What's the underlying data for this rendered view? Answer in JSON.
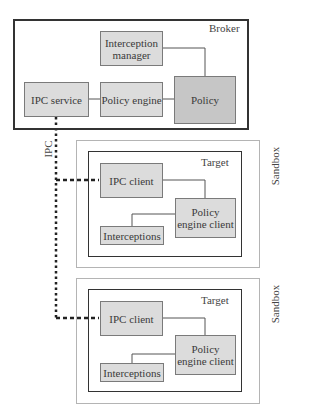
{
  "broker": {
    "label": "Broker",
    "nodes": {
      "interception_manager": "Interception manager",
      "ipc_service": "IPC service",
      "policy_engine": "Policy engine",
      "policy": "Policy"
    }
  },
  "channel": {
    "label": "IPC"
  },
  "sandboxes": [
    {
      "label": "Sandbox",
      "target": {
        "label": "Target",
        "nodes": {
          "ipc_client": "IPC client",
          "policy_engine_client": "Policy engine client",
          "interceptions": "Interceptions"
        }
      }
    },
    {
      "label": "Sandbox",
      "target": {
        "label": "Target",
        "nodes": {
          "ipc_client": "IPC client",
          "policy_engine_client": "Policy engine client",
          "interceptions": "Interceptions"
        }
      }
    }
  ],
  "colors": {
    "node_fill": "#dcdcdc",
    "policy_fill": "#c6c6c6",
    "frame": "#333333",
    "sandbox_frame": "#b4b4b4"
  }
}
